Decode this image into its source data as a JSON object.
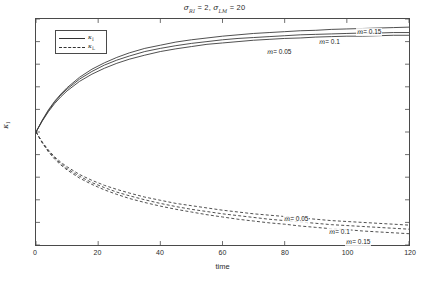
{
  "chart_data": {
    "type": "line",
    "title": "σRI = 2, σLM = 20",
    "title_parts": {
      "sym1": "σ",
      "sub1": "RI",
      "val1": "= 2,",
      "sym2": "σ",
      "sub2": "LM",
      "val2": "= 20"
    },
    "xlabel": "time",
    "ylabel": "κI",
    "ylabel_parts": {
      "sym": "κ",
      "sub": "I"
    },
    "xlim": [
      0,
      120
    ],
    "ylim": [
      0.25,
      0.75
    ],
    "xticks": [
      0,
      20,
      40,
      60,
      80,
      100,
      120
    ],
    "yticks": [
      0.25,
      0.3,
      0.35,
      0.4,
      0.45,
      0.5,
      0.55,
      0.6,
      0.65,
      0.7,
      0.75
    ],
    "ytick_labels": [
      "0.25",
      "0.3",
      "0.35",
      "0.4",
      "0.45",
      "0.5",
      "0.55",
      "0.6",
      "0.65",
      "0.7",
      "0.75"
    ],
    "xtick_labels": [
      "0",
      "20",
      "40",
      "60",
      "80",
      "100",
      "120"
    ],
    "grid": false,
    "legend_position": "upper-left",
    "legend": [
      {
        "label": "κI",
        "sym": "κ",
        "sub": "I",
        "style": "solid",
        "color": "#333333"
      },
      {
        "label": "κL",
        "sym": "κ",
        "sub": "L",
        "style": "dashed",
        "color": "#333333"
      }
    ],
    "x": [
      0,
      2,
      4,
      6,
      8,
      10,
      14,
      18,
      22,
      26,
      30,
      35,
      40,
      45,
      50,
      55,
      60,
      65,
      70,
      75,
      80,
      85,
      90,
      95,
      100,
      105,
      110,
      115,
      120
    ],
    "series": [
      {
        "name": "kappa_I m=0.05",
        "group": "solid",
        "m": 0.05,
        "style": "solid",
        "color": "#3a3a3a",
        "values": [
          0.5,
          0.524,
          0.545,
          0.563,
          0.578,
          0.591,
          0.612,
          0.628,
          0.641,
          0.652,
          0.661,
          0.67,
          0.678,
          0.684,
          0.689,
          0.694,
          0.697,
          0.7,
          0.703,
          0.705,
          0.707,
          0.708,
          0.71,
          0.711,
          0.712,
          0.712,
          0.713,
          0.714,
          0.714
        ]
      },
      {
        "name": "kappa_I m=0.1",
        "group": "solid",
        "m": 0.1,
        "style": "solid",
        "color": "#3a3a3a",
        "values": [
          0.5,
          0.525,
          0.547,
          0.566,
          0.582,
          0.595,
          0.617,
          0.634,
          0.648,
          0.659,
          0.668,
          0.678,
          0.685,
          0.691,
          0.696,
          0.7,
          0.704,
          0.707,
          0.709,
          0.711,
          0.713,
          0.715,
          0.716,
          0.717,
          0.718,
          0.719,
          0.719,
          0.72,
          0.72
        ]
      },
      {
        "name": "kappa_I m=0.15",
        "group": "solid",
        "m": 0.15,
        "style": "solid",
        "color": "#3a3a3a",
        "values": [
          0.5,
          0.526,
          0.549,
          0.568,
          0.584,
          0.598,
          0.621,
          0.639,
          0.653,
          0.665,
          0.675,
          0.685,
          0.692,
          0.699,
          0.704,
          0.708,
          0.712,
          0.715,
          0.718,
          0.72,
          0.722,
          0.724,
          0.725,
          0.727,
          0.728,
          0.729,
          0.73,
          0.731,
          0.732
        ]
      },
      {
        "name": "kappa_L m=0.05",
        "group": "dashed",
        "m": 0.05,
        "style": "dashed",
        "color": "#3a3a3a",
        "values": [
          0.5,
          0.478,
          0.46,
          0.445,
          0.433,
          0.423,
          0.406,
          0.393,
          0.382,
          0.373,
          0.365,
          0.356,
          0.349,
          0.342,
          0.337,
          0.332,
          0.327,
          0.323,
          0.319,
          0.316,
          0.313,
          0.31,
          0.307,
          0.304,
          0.302,
          0.3,
          0.298,
          0.296,
          0.294
        ]
      },
      {
        "name": "kappa_L m=0.1",
        "group": "dashed",
        "m": 0.1,
        "style": "dashed",
        "color": "#3a3a3a",
        "values": [
          0.5,
          0.477,
          0.458,
          0.443,
          0.43,
          0.419,
          0.402,
          0.388,
          0.377,
          0.367,
          0.359,
          0.35,
          0.342,
          0.335,
          0.329,
          0.324,
          0.319,
          0.315,
          0.311,
          0.307,
          0.304,
          0.301,
          0.298,
          0.295,
          0.293,
          0.291,
          0.289,
          0.287,
          0.285
        ]
      },
      {
        "name": "kappa_L m=0.15",
        "group": "dashed",
        "m": 0.15,
        "style": "dashed",
        "color": "#3a3a3a",
        "values": [
          0.5,
          0.476,
          0.456,
          0.44,
          0.427,
          0.416,
          0.398,
          0.384,
          0.372,
          0.362,
          0.353,
          0.344,
          0.336,
          0.329,
          0.323,
          0.317,
          0.312,
          0.307,
          0.303,
          0.299,
          0.296,
          0.292,
          0.289,
          0.286,
          0.284,
          0.281,
          0.279,
          0.277,
          0.275
        ]
      }
    ],
    "annotations": [
      {
        "text": "m= 0.15",
        "x_px": 356,
        "y_px": 28,
        "series": "kappa_I m=0.15"
      },
      {
        "text": "m= 0.1",
        "x_px": 318,
        "y_px": 38,
        "series": "kappa_I m=0.1"
      },
      {
        "text": "m= 0.05",
        "x_px": 266,
        "y_px": 48,
        "series": "kappa_I m=0.05"
      },
      {
        "text": "m= 0.05",
        "x_px": 283,
        "y_px": 215,
        "series": "kappa_L m=0.05"
      },
      {
        "text": "m= 0.1",
        "x_px": 328,
        "y_px": 228,
        "series": "kappa_L m=0.1"
      },
      {
        "text": "m= 0.15",
        "x_px": 345,
        "y_px": 238,
        "series": "kappa_L m=0.15"
      }
    ]
  }
}
